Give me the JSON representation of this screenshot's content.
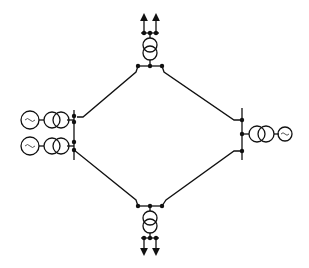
{
  "diagram": {
    "type": "single-line power network (ring topology)",
    "nodes": [
      {
        "id": "top-substation",
        "kind": "step-down transformer substation with two outgoing feeders"
      },
      {
        "id": "left-plant",
        "kind": "two generators with step-up transformers"
      },
      {
        "id": "right-plant",
        "kind": "one generator with step-up transformer"
      },
      {
        "id": "bottom-substation",
        "kind": "step-down transformer substation with two outgoing feeders"
      }
    ],
    "edges": [
      {
        "from": "top-substation",
        "to": "left-plant"
      },
      {
        "from": "top-substation",
        "to": "right-plant"
      },
      {
        "from": "left-plant",
        "to": "bottom-substation"
      },
      {
        "from": "right-plant",
        "to": "bottom-substation"
      }
    ],
    "symbols": {
      "generator": "~",
      "line_color": "#111111",
      "background": "#ffffff"
    }
  }
}
